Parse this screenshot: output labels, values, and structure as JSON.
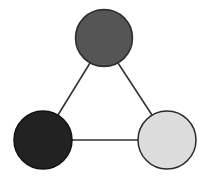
{
  "diagram": {
    "type": "triangle-graph",
    "nodes": [
      {
        "id": "top",
        "cx": 104,
        "cy": 38,
        "r": 28.5,
        "fill": "#555555",
        "stroke": "#2a2a2a"
      },
      {
        "id": "bottom-left",
        "cx": 43,
        "cy": 140,
        "r": 29,
        "fill": "#222222",
        "stroke": "#111111"
      },
      {
        "id": "bottom-right",
        "cx": 167,
        "cy": 140,
        "r": 29,
        "fill": "#dcdcdc",
        "stroke": "#2a2a2a"
      }
    ],
    "edges": [
      {
        "from": "top",
        "to": "bottom-left",
        "x1": 90,
        "y1": 63,
        "x2": 58,
        "y2": 115
      },
      {
        "from": "top",
        "to": "bottom-right",
        "x1": 118,
        "y1": 63,
        "x2": 152,
        "y2": 115
      },
      {
        "from": "bottom-left",
        "to": "bottom-right",
        "x1": 72,
        "y1": 140,
        "x2": 138,
        "y2": 140
      }
    ],
    "edge_color": "#333333",
    "edge_width": 1.6
  }
}
